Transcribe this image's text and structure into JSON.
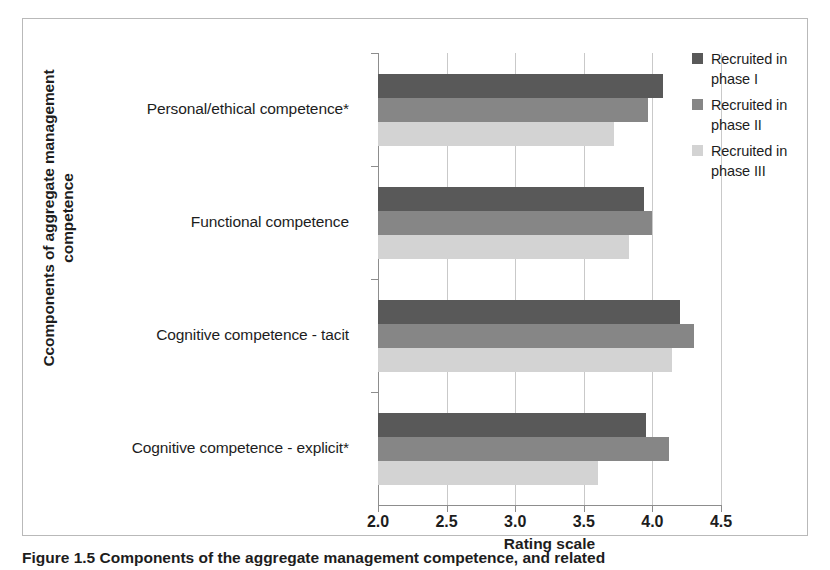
{
  "chart_data": {
    "type": "bar",
    "orientation": "horizontal",
    "title": "",
    "xlabel": "Rating scale",
    "ylabel": "Ccomponents of aggregate management competence",
    "ylabel_line1": "Ccomponents of aggregate management",
    "ylabel_line2": "competence",
    "xlim": [
      2.0,
      4.5
    ],
    "xticks": [
      "2.0",
      "2.5",
      "3.0",
      "3.5",
      "4.0",
      "4.5"
    ],
    "xtick_values": [
      2.0,
      2.5,
      3.0,
      3.5,
      4.0,
      4.5
    ],
    "grid": "vertical",
    "legend_position": "right",
    "categories": [
      "Personal/ethical competence*",
      "Functional competence",
      "Cognitive competence - tacit",
      "Cognitive competence - explicit*"
    ],
    "series": [
      {
        "name": "Recruited in phase I",
        "legend_line1": "Recruited in",
        "legend_line2": "phase I",
        "color": "#595959",
        "values": [
          4.08,
          3.94,
          4.2,
          3.95
        ]
      },
      {
        "name": "Recruited in phase II",
        "legend_line1": "Recruited in",
        "legend_line2": "phase II",
        "color": "#868686",
        "values": [
          3.97,
          4.0,
          4.3,
          4.12
        ]
      },
      {
        "name": "Recruited in phase III",
        "legend_line1": "Recruited in",
        "legend_line2": "phase III",
        "color": "#d3d3d3",
        "values": [
          3.72,
          3.83,
          4.14,
          3.6
        ]
      }
    ]
  },
  "caption": "Figure 1.5  Components of the aggregate management competence, and related"
}
